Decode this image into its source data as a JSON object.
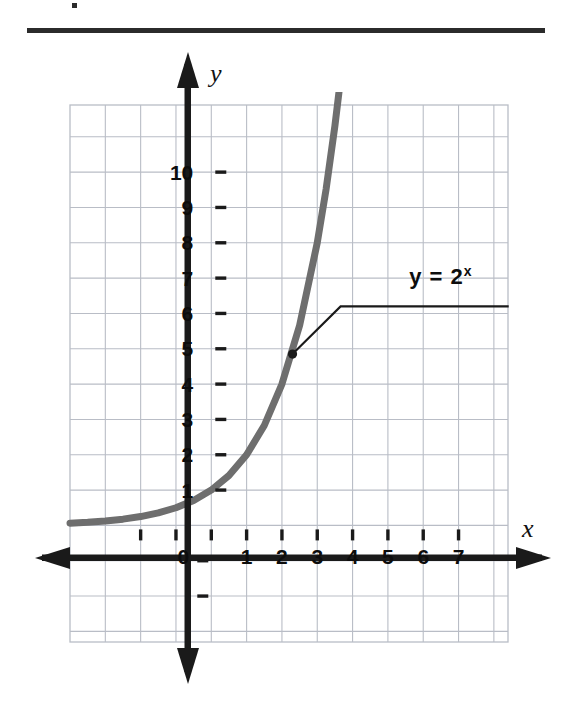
{
  "figure": {
    "background_color": "#ffffff",
    "top_rule_color": "#2b2b2b",
    "axis_color": "#1a1a1a",
    "grid_color": "#b9bdc6",
    "curve_color": "#6e6e6e",
    "leader_color": "#1a1a1a",
    "y_axis_name": "y",
    "x_axis_name": "x"
  },
  "chart_data": {
    "type": "line",
    "title": "",
    "subtitle": "",
    "xlabel": "x",
    "ylabel": "y",
    "function": "y = 2^x",
    "equation_base": "y = 2",
    "equation_exponent": "x",
    "grid": true,
    "grid_step": 1,
    "legend_position": "inline-callout",
    "xlim": [
      -4.0,
      8.4
    ],
    "ylim": [
      -3.3,
      11.9
    ],
    "xticks": [
      0,
      1,
      2,
      3,
      4,
      5,
      6,
      7
    ],
    "xtick_labels": [
      "0",
      "1",
      "2",
      "3",
      "4",
      "5",
      "6",
      "7"
    ],
    "yticks": [
      1,
      2,
      3,
      4,
      5,
      6,
      7,
      8,
      9,
      10
    ],
    "ytick_labels": [
      "1",
      "2",
      "3",
      "4",
      "5",
      "6",
      "7",
      "8",
      "9",
      "10"
    ],
    "series": [
      {
        "name": "y = 2^x",
        "color": "#6e6e6e",
        "x": [
          -4.0,
          -3.5,
          -3.0,
          -2.5,
          -2.0,
          -1.5,
          -1.0,
          -0.5,
          0.0,
          0.5,
          1.0,
          1.5,
          2.0,
          2.5,
          3.0,
          3.25,
          3.5,
          3.66
        ],
        "y": [
          0.063,
          0.088,
          0.125,
          0.177,
          0.25,
          0.354,
          0.5,
          0.707,
          1.0,
          1.414,
          2.0,
          2.828,
          4.0,
          5.657,
          8.0,
          9.514,
          11.314,
          12.64
        ]
      }
    ],
    "annotation": {
      "label": "y = 2ˣ",
      "point": [
        2.3,
        4.85
      ],
      "elbow": [
        3.66,
        6.2
      ],
      "line_end_x": 8.42,
      "label_x": 6.5,
      "label_y": 7.0
    }
  }
}
